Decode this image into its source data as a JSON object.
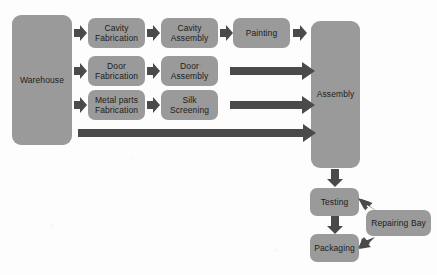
{
  "diagram": {
    "type": "flowchart",
    "background_color": "#fdfdfd",
    "node_color": "#9a9a9a",
    "arrow_color": "#4a4a4a",
    "text_color": "#1c1c1c",
    "nodes": [
      {
        "id": "warehouse",
        "label": "Warehouse",
        "x": 12,
        "y": 15,
        "w": 60,
        "h": 130
      },
      {
        "id": "cavity_fab",
        "label": "Cavity\nFabrication",
        "x": 88,
        "y": 18,
        "w": 57,
        "h": 30
      },
      {
        "id": "cavity_asm",
        "label": "Cavity\nAssembly",
        "x": 161,
        "y": 18,
        "w": 57,
        "h": 30
      },
      {
        "id": "painting",
        "label": "Painting",
        "x": 233,
        "y": 18,
        "w": 57,
        "h": 30
      },
      {
        "id": "door_fab",
        "label": "Door\nFabrication",
        "x": 88,
        "y": 56,
        "w": 57,
        "h": 30
      },
      {
        "id": "door_asm",
        "label": "Door\nAssembly",
        "x": 161,
        "y": 56,
        "w": 57,
        "h": 30
      },
      {
        "id": "metal_fab",
        "label": "Metal parts\nFabrication",
        "x": 88,
        "y": 90,
        "w": 57,
        "h": 30
      },
      {
        "id": "silk_screening",
        "label": "Silk Screening",
        "x": 161,
        "y": 90,
        "w": 57,
        "h": 30
      },
      {
        "id": "assembly",
        "label": "Assembly",
        "x": 311,
        "y": 21,
        "w": 49,
        "h": 147
      },
      {
        "id": "testing",
        "label": "Testing",
        "x": 310,
        "y": 188,
        "w": 49,
        "h": 28
      },
      {
        "id": "packaging",
        "label": "Packaging",
        "x": 310,
        "y": 234,
        "w": 49,
        "h": 28
      },
      {
        "id": "repairing_bay",
        "label": "Repairing Bay",
        "x": 366,
        "y": 210,
        "w": 65,
        "h": 26
      }
    ],
    "edges": [
      {
        "from": "warehouse",
        "to": "cavity_fab",
        "kind": "short-right"
      },
      {
        "from": "warehouse",
        "to": "door_fab",
        "kind": "short-right"
      },
      {
        "from": "warehouse",
        "to": "metal_fab",
        "kind": "short-right"
      },
      {
        "from": "cavity_fab",
        "to": "cavity_asm",
        "kind": "short-right"
      },
      {
        "from": "cavity_asm",
        "to": "painting",
        "kind": "short-right"
      },
      {
        "from": "painting",
        "to": "assembly",
        "kind": "short-right"
      },
      {
        "from": "door_fab",
        "to": "door_asm",
        "kind": "short-right"
      },
      {
        "from": "metal_fab",
        "to": "silk_screening",
        "kind": "short-right"
      },
      {
        "from": "door_asm",
        "to": "assembly",
        "kind": "long-right"
      },
      {
        "from": "silk_screening",
        "to": "assembly",
        "kind": "long-right"
      },
      {
        "from": "warehouse",
        "to": "assembly",
        "kind": "long-right"
      },
      {
        "from": "assembly",
        "to": "testing",
        "kind": "down"
      },
      {
        "from": "testing",
        "to": "packaging",
        "kind": "down"
      },
      {
        "from": "repairing_bay",
        "to": "testing",
        "kind": "diag-left"
      },
      {
        "from": "repairing_bay",
        "to": "packaging",
        "kind": "diag-left"
      }
    ]
  }
}
